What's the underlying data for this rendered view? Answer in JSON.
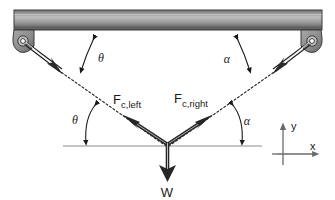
{
  "figure": {
    "background_color": "#ffffff"
  },
  "beam": {
    "name": "horizontal-beam",
    "x": 14,
    "y": 10,
    "width": 308,
    "height": 20,
    "color_top": "#6e6e6e",
    "color_mid": "#b9b9b9",
    "color_bottom": "#5a5a5a",
    "edge_color": "#3d3d3d"
  },
  "anchors": [
    {
      "name": "anchor-bracket-left",
      "cx": 22,
      "cy": 40,
      "hole_color": "#ffffff",
      "body_color": "#8a8a8a",
      "edge_color": "#3a3a3a"
    },
    {
      "name": "anchor-bracket-right",
      "cx": 313,
      "cy": 40,
      "hole_color": "#ffffff",
      "body_color": "#8a8a8a",
      "edge_color": "#3a3a3a"
    }
  ],
  "cables": [
    {
      "name": "cable-left",
      "from_x": 24,
      "from_y": 42,
      "to_x": 63,
      "to_y": 73,
      "color": "#2b2b2b",
      "style": "double-line-with-arrowhead"
    },
    {
      "name": "cable-right",
      "from_x": 311,
      "from_y": 42,
      "to_x": 272,
      "to_y": 73,
      "color": "#2b2b2b",
      "style": "double-line-with-arrowhead"
    }
  ],
  "dotted_lines": [
    {
      "name": "line-of-action-left",
      "from_x": 62,
      "from_y": 72,
      "to_x": 166,
      "to_y": 145,
      "color": "#1a1a1a",
      "dash": "2 2"
    },
    {
      "name": "line-of-action-right",
      "from_x": 273,
      "from_y": 72,
      "to_x": 168,
      "to_y": 145,
      "color": "#1a1a1a",
      "dash": "2 2"
    }
  ],
  "force_vectors": [
    {
      "name": "force-cable-left-vector",
      "label": "F",
      "sub": "c,left",
      "from_x": 166,
      "from_y": 143,
      "to_x": 124,
      "to_y": 116,
      "label_x": 118,
      "label_y": 101,
      "color": "#262626"
    },
    {
      "name": "force-cable-right-vector",
      "label": "F",
      "sub": "c,right",
      "from_x": 169,
      "from_y": 143,
      "to_x": 211,
      "to_y": 116,
      "label_x": 174,
      "label_y": 101,
      "color": "#262626"
    },
    {
      "name": "weight-vector",
      "label": "W",
      "sub": "",
      "from_x": 167,
      "from_y": 145,
      "to_x": 167,
      "to_y": 180,
      "label_x": 167,
      "label_y": 196,
      "color": "#262626"
    }
  ],
  "angles": [
    {
      "name": "angle-theta-top",
      "label": "θ",
      "label_x": 101,
      "label_y": 60,
      "arc_from_x": 94,
      "arc_from_y": 36,
      "arc_to_x": 80,
      "arc_to_y": 73,
      "color": "#1a1a1a"
    },
    {
      "name": "angle-alpha-top",
      "label": "α",
      "label_x": 227,
      "label_y": 61,
      "arc_from_x": 236,
      "arc_from_y": 36,
      "arc_to_x": 251,
      "arc_to_y": 73,
      "color": "#1a1a1a"
    },
    {
      "name": "angle-theta-bottom",
      "label": "θ",
      "label_x": 75,
      "label_y": 120,
      "arc_from_x": 97,
      "arc_from_y": 103,
      "arc_to_x": 88,
      "arc_to_y": 145,
      "color": "#1a1a1a"
    },
    {
      "name": "angle-alpha-bottom",
      "label": "α",
      "label_x": 245,
      "label_y": 122,
      "arc_from_x": 231,
      "arc_from_y": 103,
      "arc_to_x": 240,
      "arc_to_y": 145,
      "color": "#1a1a1a"
    }
  ],
  "reference_line": {
    "name": "horizontal-reference-line",
    "x1": 63,
    "y1": 146,
    "x2": 262,
    "y2": 146,
    "color": "#8c8c8c"
  },
  "coordinate_axes": {
    "name": "coordinate-axes",
    "origin_x": 283,
    "origin_y": 158,
    "x_label": "x",
    "y_label": "y",
    "x_tip_x": 320,
    "y_tip_y": 122,
    "x_label_x": 313,
    "x_label_y": 150,
    "y_label_x": 292,
    "y_label_y": 127,
    "color": "#6a6a6a"
  }
}
